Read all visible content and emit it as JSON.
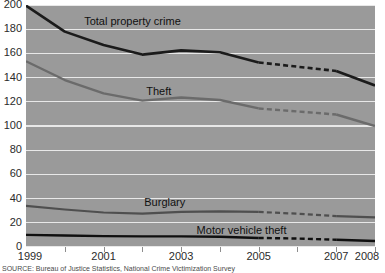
{
  "chart_data": {
    "type": "line",
    "title": "",
    "xlabel": "",
    "ylabel": "",
    "xlim": [
      1999,
      2008
    ],
    "ylim": [
      0,
      200
    ],
    "grid": true,
    "legend_position": "inline-on-lines",
    "x": [
      1999,
      2000,
      2001,
      2002,
      2003,
      2004,
      2005,
      2006,
      2007,
      2008
    ],
    "x_tick_labels": [
      "1999",
      "2001",
      "2003",
      "2005",
      "2007",
      "2008"
    ],
    "x_tick_values": [
      1999,
      2001,
      2003,
      2005,
      2007,
      2008
    ],
    "y_tick_labels": [
      "0",
      "20",
      "40",
      "60",
      "80",
      "100",
      "120",
      "140",
      "160",
      "180",
      "200"
    ],
    "y_tick_values": [
      0,
      20,
      40,
      60,
      80,
      100,
      120,
      140,
      160,
      180,
      200
    ],
    "dashed_from": 2005,
    "dashed_to": 2007,
    "series": [
      {
        "name": "Total property crime",
        "color": "#1b1b1b",
        "width": 2.6,
        "label_x": 2000.5,
        "label_y": 186,
        "values": [
          199.5,
          178,
          167,
          159,
          162.5,
          161,
          152.5,
          149,
          145.5,
          133.5
        ]
      },
      {
        "name": "Theft",
        "color": "#6b6b6b",
        "width": 2.4,
        "label_x": 2002.1,
        "label_y": 128,
        "values": [
          153.5,
          138,
          127,
          121,
          123.5,
          121.5,
          114.5,
          112,
          109.5,
          100
        ]
      },
      {
        "name": "Burglary",
        "color": "#4f4f4f",
        "width": 2.2,
        "label_x": 2002.05,
        "label_y": 36,
        "values": [
          34,
          31,
          28.5,
          27.5,
          29,
          29.5,
          29,
          27.5,
          25.5,
          24.5
        ]
      },
      {
        "name": "Motor vehicle theft",
        "color": "#0f0f0f",
        "width": 2.4,
        "label_x": 2003.4,
        "label_y": 13.5,
        "values": [
          10,
          9.5,
          9,
          8.8,
          8.8,
          8.5,
          7.5,
          7,
          6,
          5
        ]
      }
    ]
  },
  "caption": {
    "text": "SOURCE: Bureau of Justice Statistics, National Crime Victimization Survey"
  },
  "colors": {
    "plot_background": "#9a9a9a",
    "gridline": "#e8e8e8",
    "page_background": "#ffffff",
    "tick_text": "#2b2b2b"
  }
}
